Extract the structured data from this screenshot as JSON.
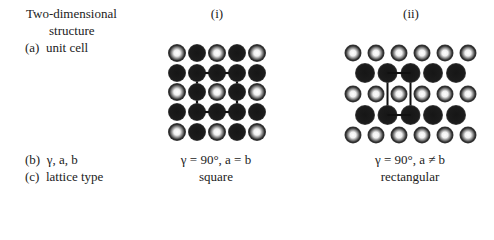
{
  "header": {
    "row_title_line1": "Two-dimensional",
    "row_title_line2": "structure",
    "columns": [
      {
        "label": "(i)"
      },
      {
        "label": "(ii)"
      }
    ]
  },
  "rows": {
    "a_label": "(a)  unit cell",
    "b_label": "(b)  γ, a, b",
    "c_label": "(c)  lattice type"
  },
  "lattices": [
    {
      "id": "square",
      "params": "γ = 90°, a = b",
      "type": "square",
      "grid": "5x5",
      "pattern": "hollow atoms at even-row/even-col positions, dark atoms elsewhere",
      "unit_cell": "square outlined linking dark atoms (row2,col2)-(row2,col4)-(row4,col4)-(row4,col2)"
    },
    {
      "id": "rectangular",
      "params": "γ = 90°, a ≠ b",
      "type": "rectangular",
      "grid": "rows of 6 hollow atoms alternating with rows of 5 dark atoms",
      "unit_cell": "rectangle linking dark atoms (row2,#2)-(row2,#3)-(row4,#3)-(row4,#2)"
    }
  ],
  "colors": {
    "dark_atom": "#1a1a1a",
    "hollow_atom_rim": "#2a2a2a",
    "hollow_atom_center": "#ffffff",
    "text": "#222222"
  }
}
